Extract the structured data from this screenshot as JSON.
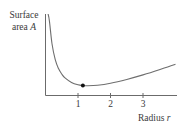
{
  "chart_data": {
    "type": "line",
    "title": "",
    "ylabel_line1": "Surface",
    "ylabel_line2_prefix": "area ",
    "ylabel_var": "A",
    "xlabel_prefix": "Radius ",
    "xlabel_var": "r",
    "x_ticks": [
      "1",
      "2",
      "3"
    ],
    "x_tick_values": [
      1,
      2,
      3
    ],
    "xlim": [
      0,
      4.05
    ],
    "grid": false,
    "legend": null,
    "series": [
      {
        "name": "A(r)",
        "x": [
          0.08,
          0.12,
          0.2,
          0.3,
          0.4,
          0.5,
          0.6,
          0.8,
          1.0,
          1.15,
          1.3,
          1.6,
          2.0,
          2.5,
          3.0,
          3.5,
          4.0
        ],
        "y": [
          82.0,
          75.5,
          53.7,
          38.5,
          30.0,
          24.8,
          21.1,
          16.8,
          14.6,
          13.9,
          13.7,
          14.2,
          16.1,
          19.7,
          24.0,
          28.9,
          34.2
        ]
      }
    ],
    "annotations": [
      {
        "type": "point",
        "label": "minimum",
        "x": 1.15,
        "y": 13.9
      }
    ]
  }
}
